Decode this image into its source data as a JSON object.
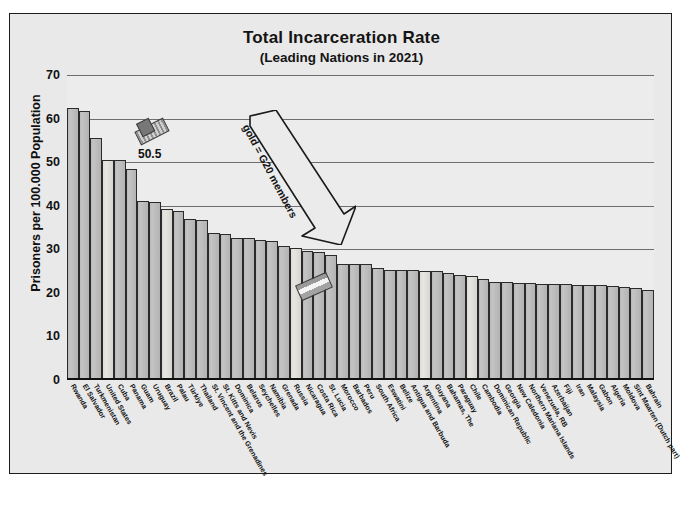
{
  "chart_data": {
    "type": "bar",
    "title": "Total Incarceration Rate",
    "subtitle": "(Leading Nations in 2021)",
    "xlabel": "",
    "ylabel": "Prisoners per 100.000 Population",
    "ylim": [
      0,
      70
    ],
    "yticks": [
      70,
      60,
      50,
      40,
      30,
      20,
      10,
      0
    ],
    "grid": true,
    "legend": "none",
    "annotations": [
      {
        "name": "data-label",
        "text": "50.5",
        "target": "United States"
      },
      {
        "name": "g20-arrow-label",
        "text": "gold = G20 members",
        "target": "Russia"
      }
    ],
    "series_name": "Prisoners per 100.000 Population",
    "highlight_color": "#e1e0d8",
    "bar_color": "#bcbcbc",
    "categories": [
      "Rwanda",
      "El Salvador",
      "Turkmenistan",
      "United States",
      "Cuba",
      "Panama",
      "Guam",
      "Uruguay",
      "Brazil",
      "Palau",
      "Türkiye",
      "Thailand",
      "St. Vincent and the Grenadines",
      "St. Kitts and Nevis",
      "Dominica",
      "Belarus",
      "Seychelles",
      "Namibia",
      "Grenada",
      "Russia",
      "Nicaragua",
      "Costa Rica",
      "St. Lucia",
      "Morocco",
      "Barbados",
      "Peru",
      "South Africa",
      "Eswatini",
      "Belize",
      "Antigua and Barbuda",
      "Argentina",
      "Guyana",
      "Bahamas, The",
      "Paraguay",
      "Chile",
      "Cambodia",
      "Dominican Republic",
      "Georgia",
      "New Caledonia",
      "Northern Mariana Islands",
      "Venezuela, RB",
      "Azerbaijan",
      "Fiji",
      "Iran",
      "Malaysia",
      "Gabon",
      "Algeria",
      "Moldova",
      "Sint Maarten (Dutch part)",
      "Bahrain"
    ],
    "values": [
      62.5,
      61.8,
      55.5,
      50.5,
      50.4,
      48.5,
      41.0,
      40.8,
      39.2,
      38.8,
      37.0,
      36.7,
      33.8,
      33.4,
      32.7,
      32.5,
      32.2,
      31.9,
      30.7,
      30.3,
      29.5,
      29.3,
      28.8,
      26.7,
      26.6,
      26.6,
      25.6,
      25.3,
      25.2,
      25.2,
      25.1,
      25.0,
      24.5,
      24.1,
      23.8,
      23.2,
      22.6,
      22.4,
      22.3,
      22.2,
      22.1,
      22.1,
      22.0,
      21.9,
      21.8,
      21.7,
      21.6,
      21.4,
      21.1,
      20.6
    ],
    "gold_members": [
      "United States",
      "Brazil",
      "Türkiye",
      "Russia",
      "Argentina",
      "South Africa",
      "Mexico"
    ],
    "gold_indices": [
      3,
      8,
      19,
      30,
      34
    ]
  }
}
